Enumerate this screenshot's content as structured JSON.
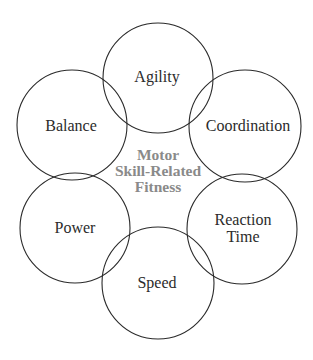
{
  "diagram": {
    "type": "concept-ring",
    "center": {
      "lines": [
        "Motor",
        "Skill-Related",
        "Fitness"
      ],
      "color": "#8a8a8a"
    },
    "nodes": [
      {
        "id": "agility",
        "lines": [
          "Agility"
        ],
        "cx": 158,
        "cy": 78,
        "r": 55
      },
      {
        "id": "coordination",
        "lines": [
          "Coordination"
        ],
        "cx": 245,
        "cy": 126,
        "r": 56
      },
      {
        "id": "reaction-time",
        "lines": [
          "Reaction",
          "Time"
        ],
        "cx": 242,
        "cy": 229,
        "r": 55
      },
      {
        "id": "speed",
        "lines": [
          "Speed"
        ],
        "cx": 158,
        "cy": 283,
        "r": 56
      },
      {
        "id": "power",
        "lines": [
          "Power"
        ],
        "cx": 75,
        "cy": 228,
        "r": 55
      },
      {
        "id": "balance",
        "lines": [
          "Balance"
        ],
        "cx": 72,
        "cy": 125,
        "r": 55
      }
    ],
    "stroke_color": "#2a2a2a",
    "text_color": "#2b2b2b"
  }
}
